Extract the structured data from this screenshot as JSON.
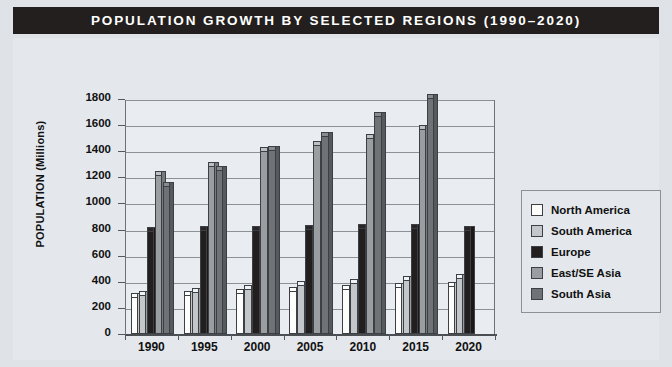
{
  "title": "POPULATION GROWTH BY SELECTED REGIONS (1990–2020)",
  "axis": {
    "ylabel": "POPULATION (Millions)",
    "xlabel": "YEAR"
  },
  "legend": {
    "items": [
      {
        "label": "North America",
        "color": "#fdfdfb"
      },
      {
        "label": "South America",
        "color": "#c3c7ca"
      },
      {
        "label": "Europe",
        "color": "#231f1e"
      },
      {
        "label": "East/SE Asia",
        "color": "#9a9ea1"
      },
      {
        "label": "South Asia",
        "color": "#6f7376"
      }
    ]
  },
  "chart_data": {
    "type": "bar",
    "title": "POPULATION GROWTH BY SELECTED REGIONS (1990–2020)",
    "xlabel": "YEAR",
    "ylabel": "POPULATION (Millions)",
    "categories": [
      "1990",
      "1995",
      "2000",
      "2005",
      "2010",
      "2015",
      "2020"
    ],
    "ylim": [
      0,
      1800
    ],
    "yticks": [
      0,
      200,
      400,
      600,
      800,
      1000,
      1200,
      1400,
      1600,
      1800
    ],
    "grid": true,
    "legend_position": "right",
    "series": [
      {
        "name": "North America",
        "color": "#fdfdfb",
        "values": [
          280,
          295,
          313,
          330,
          343,
          357,
          368
        ]
      },
      {
        "name": "South America",
        "color": "#c3c7ca",
        "values": [
          296,
          320,
          348,
          372,
          393,
          414,
          430
        ]
      },
      {
        "name": "Europe",
        "color": "#231f1e",
        "values": [
          788,
          795,
          800,
          805,
          810,
          815,
          800
        ]
      },
      {
        "name": "East/SE Asia",
        "color": "#9a9ea1",
        "values": [
          1220,
          1290,
          1400,
          1450,
          1500,
          1570,
          null
        ]
      },
      {
        "name": "South Asia",
        "color": "#6f7376",
        "values": [
          1130,
          1260,
          1410,
          1520,
          1670,
          1810,
          null
        ]
      }
    ]
  }
}
